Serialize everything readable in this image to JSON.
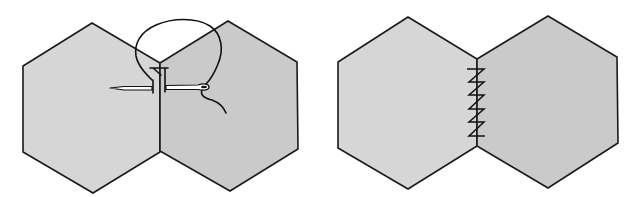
{
  "figure": {
    "background": "#ffffff",
    "colors": {
      "fabric_fill_light": "#d4d4d4",
      "fabric_fill_dark": "#c8c8c8",
      "line": "#1a1a1a"
    },
    "panels": [
      {
        "id": "step-1",
        "label": "Needle passing through the edges of two hexagons",
        "hexagons": [
          {
            "points": "92,23 160,63 160,152 93,193 23,152 23,66",
            "fill": "#d6d6d6"
          },
          {
            "points": "228,21 297,62 298,149 230,191 160,151 160,63",
            "fill": "#cacaca"
          }
        ],
        "needle": {
          "tip": [
            110,
            88
          ],
          "eye": [
            205,
            86
          ]
        }
      },
      {
        "id": "step-2",
        "label": "Finished whip stitches along the seam",
        "hexagons": [
          {
            "points": "408,17 477,59 477,146 408,189 338,148 338,62",
            "fill": "#d6d6d6"
          },
          {
            "points": "548,16 617,57 618,143 548,188 477,146 477,59",
            "fill": "#cacaca"
          }
        ],
        "stitch_count": 5
      }
    ]
  }
}
